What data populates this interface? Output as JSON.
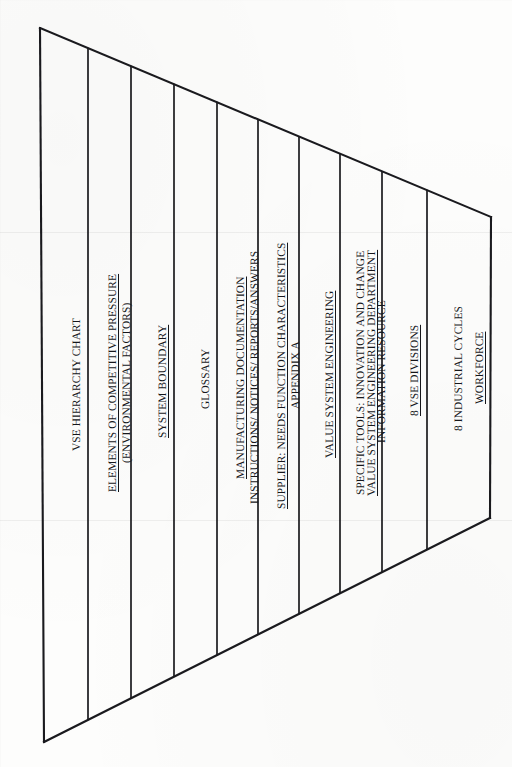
{
  "document": {
    "kind": "scanned-diagram",
    "title": "VSE HIERARCHY CHART",
    "orientation": "rotated-90-ccw",
    "shape": "trapezoid",
    "ink_color": "#16161a",
    "paper_color": "#fdfdfc"
  },
  "bands": [
    {
      "id": "band-1",
      "lines": [
        {
          "text": "VSE HIERARCHY CHART",
          "underline": false
        }
      ]
    },
    {
      "id": "band-2",
      "lines": [
        {
          "text": "ELEMENTS OF COMPETITIVE PRESSURE",
          "underline": true
        },
        {
          "text": "(ENVIRONMENTAL FACTORS)",
          "underline": false
        }
      ]
    },
    {
      "id": "band-3",
      "lines": [
        {
          "text": "SYSTEM BOUNDARY",
          "underline": true
        }
      ]
    },
    {
      "id": "band-4",
      "lines": [
        {
          "text": "GLOSSARY",
          "underline": false
        }
      ]
    },
    {
      "id": "band-5",
      "lines": [
        {
          "text": "MANUFACTURING DOCUMENTATION",
          "underline": true
        },
        {
          "text": "INSTRUCTIONS/ NOTICES/ REPORTS/ANSWERS",
          "underline": false
        }
      ]
    },
    {
      "id": "band-6",
      "lines": [
        {
          "text": "SUPPLIER: NEEDS FUNCTION CHARACTERISTICS",
          "underline": true
        },
        {
          "text": "APPENDIX A",
          "underline": false
        }
      ]
    },
    {
      "id": "band-7",
      "lines": [
        {
          "text": "VALUE SYSTEM ENGINEERING",
          "underline": true
        }
      ]
    },
    {
      "id": "band-8",
      "lines": [
        {
          "text": "SPECIFIC TOOLS: INNOVATION AND CHANGE",
          "underline": false
        },
        {
          "text": "VALUE SYSTEM ENGINEERING DEPARTMENT",
          "underline": true
        },
        {
          "text": "INFORMATION RESOURCE",
          "underline": false
        }
      ]
    },
    {
      "id": "band-9",
      "lines": [
        {
          "text": "8 VSE DIVISIONS",
          "underline": true
        }
      ]
    },
    {
      "id": "band-10",
      "lines": [
        {
          "text": "8 INDUSTRIAL CYCLES",
          "underline": false
        },
        {
          "text": "WORKFORCE",
          "underline": true
        }
      ]
    },
    {
      "id": "band-11",
      "lines": [
        {
          "text": "COMPANY EMPLOYEE",
          "underline": false
        },
        {
          "text": "CUSTOMER",
          "underline": true
        }
      ]
    },
    {
      "id": "band-12",
      "lines": [
        {
          "text": "NEEDS",
          "underline": false
        },
        {
          "text": "STAKEHOLDERS",
          "underline": false
        }
      ]
    }
  ],
  "geometry": {
    "outline": {
      "top_left": [
        40,
        28
      ],
      "bottom_left": [
        44,
        742
      ],
      "top_right": [
        491,
        217
      ],
      "bottom_right": [
        490,
        518
      ]
    },
    "divider_x": [
      44,
      88,
      131,
      174,
      217,
      258,
      299,
      340,
      382,
      427
    ]
  }
}
